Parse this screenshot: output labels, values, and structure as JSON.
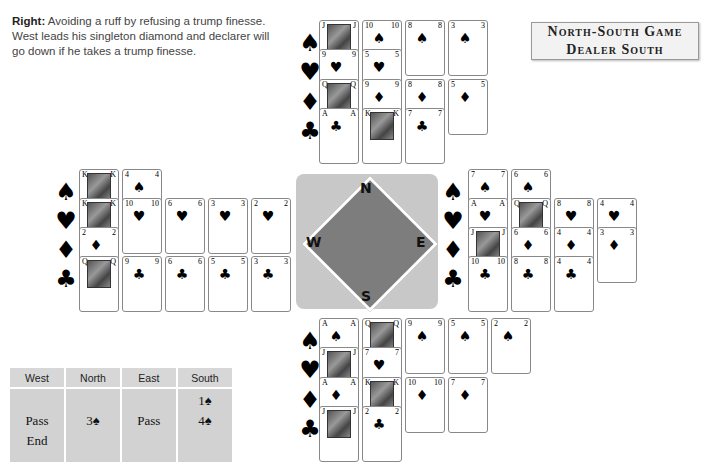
{
  "caption": {
    "bold": "Right:",
    "text": "Avoiding a ruff by refusing a trump finesse. West leads his singleton diamond and declarer will go down if he takes a trump finesse."
  },
  "game_box": {
    "line1": "North-South Game",
    "line2": "Dealer South"
  },
  "compass": {
    "north": "N",
    "south": "S",
    "east": "E",
    "west": "W"
  },
  "suit_symbols": {
    "spades": "♠",
    "hearts": "♥",
    "diamonds": "♦",
    "clubs": "♣"
  },
  "hands": {
    "north": {
      "spades": [
        "J",
        "10",
        "8",
        "3"
      ],
      "hearts": [
        "9",
        "5"
      ],
      "diamonds": [
        "Q",
        "9",
        "8",
        "5"
      ],
      "clubs": [
        "A",
        "K",
        "7"
      ]
    },
    "west": {
      "spades": [
        "K",
        "4"
      ],
      "hearts": [
        "K",
        "10",
        "6",
        "3",
        "2"
      ],
      "diamonds": [
        "2"
      ],
      "clubs": [
        "Q",
        "9",
        "6",
        "5",
        "3"
      ]
    },
    "east": {
      "spades": [
        "7",
        "6"
      ],
      "hearts": [
        "A",
        "Q",
        "8",
        "4"
      ],
      "diamonds": [
        "J",
        "6",
        "4",
        "3"
      ],
      "clubs": [
        "10",
        "8",
        "4"
      ]
    },
    "south": {
      "spades": [
        "A",
        "Q",
        "9",
        "5",
        "2"
      ],
      "hearts": [
        "J",
        "7"
      ],
      "diamonds": [
        "A",
        "K",
        "10",
        "7"
      ],
      "clubs": [
        "J",
        "2"
      ]
    }
  },
  "auction": {
    "headers": [
      "West",
      "North",
      "East",
      "South"
    ],
    "columns": [
      [
        "",
        "Pass",
        "End"
      ],
      [
        "",
        "3♠",
        ""
      ],
      [
        "",
        "Pass",
        ""
      ],
      [
        "1♠",
        "4♠",
        ""
      ]
    ]
  }
}
